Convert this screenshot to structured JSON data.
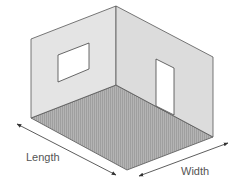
{
  "labels": {
    "length": "Length",
    "width": "Width"
  },
  "colors": {
    "background": "#ffffff",
    "left_wall": "#e4e4e4",
    "right_wall": "#dcdcdc",
    "floor": "#b4b4b4",
    "floor_hatch": "#9a9a9a",
    "outline": "#555555",
    "opening": "#ffffff",
    "arrow": "#333333",
    "label": "#555555"
  },
  "elements": {
    "left_wall": {
      "feature": "window"
    },
    "right_wall": {
      "feature": "door"
    },
    "floor": {
      "pattern": "hatched"
    }
  }
}
